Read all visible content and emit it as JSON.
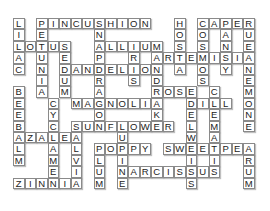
{
  "puzzle": {
    "type": "crossword",
    "theme": "flowers",
    "columns": 21,
    "rows": 15,
    "grid": [
      "L.PINCUSHION..H.CAPER",
      "I.E....N......O.O.A.U",
      "LOTUS..ALLIUM.S.S.N.E",
      "A.U.E..P..R.ARTEMISIA",
      "C.N.DANDELION.A.O.Y.N",
      "..I.U..R..S.D...S...E",
      "B.A.M..A....ROSE.C..M",
      "E..CMAGNOLIA..DILL.O",
      "E..Y...O....K..E.E..N",
      "B..C.SUNFLOWER.L.M..E",
      "AZALEA...U.....W.A...",
      "L..A.L.POPPY.SWEETPEA",
      "M..M.V.L.I.....I.I..R",
      "...E.I.U.NARCISSUS..U",
      "ZINNIA.M.E.....S....M"
    ],
    "words": {
      "across": [
        "PINCUSHION",
        "CAPER",
        "LOTUS",
        "ALLIUM",
        "ARTEMISIA",
        "DANDELION",
        "ROSE",
        "MAGNOLIA",
        "DILL",
        "SUNFLOWER",
        "AZALEA",
        "POPPY",
        "SWEETPEA",
        "NARCISSUS",
        "ZINNIA"
      ],
      "down": [
        "LILAC",
        "PETUNIA",
        "SNAPDRAGON",
        "IRIS",
        "SEDUM",
        "MANDRAKE",
        "HOSTA",
        "COSMOS",
        "PANSY",
        "RUE",
        "ANEMONE",
        "BEEBALM",
        "CYCLAMEN",
        "SALVIA",
        "LUPINE",
        "PLUM",
        "EDELWEISS",
        "CLEMATIS",
        "ARUM"
      ]
    },
    "cells": [
      {
        "r": 0,
        "c": 0,
        "ch": "L"
      },
      {
        "r": 0,
        "c": 2,
        "ch": "P"
      },
      {
        "r": 0,
        "c": 3,
        "ch": "I"
      },
      {
        "r": 0,
        "c": 4,
        "ch": "N"
      },
      {
        "r": 0,
        "c": 5,
        "ch": "C"
      },
      {
        "r": 0,
        "c": 6,
        "ch": "U"
      },
      {
        "r": 0,
        "c": 7,
        "ch": "S"
      },
      {
        "r": 0,
        "c": 8,
        "ch": "H"
      },
      {
        "r": 0,
        "c": 9,
        "ch": "I"
      },
      {
        "r": 0,
        "c": 10,
        "ch": "O"
      },
      {
        "r": 0,
        "c": 11,
        "ch": "N"
      },
      {
        "r": 0,
        "c": 14,
        "ch": "H"
      },
      {
        "r": 0,
        "c": 16,
        "ch": "C"
      },
      {
        "r": 0,
        "c": 17,
        "ch": "A"
      },
      {
        "r": 0,
        "c": 18,
        "ch": "P"
      },
      {
        "r": 0,
        "c": 19,
        "ch": "E"
      },
      {
        "r": 0,
        "c": 20,
        "ch": "R"
      },
      {
        "r": 1,
        "c": 0,
        "ch": "I"
      },
      {
        "r": 1,
        "c": 2,
        "ch": "E"
      },
      {
        "r": 1,
        "c": 7,
        "ch": "N"
      },
      {
        "r": 1,
        "c": 14,
        "ch": "O"
      },
      {
        "r": 1,
        "c": 16,
        "ch": "O"
      },
      {
        "r": 1,
        "c": 18,
        "ch": "A"
      },
      {
        "r": 1,
        "c": 20,
        "ch": "U"
      },
      {
        "r": 2,
        "c": 0,
        "ch": "L"
      },
      {
        "r": 2,
        "c": 1,
        "ch": "O"
      },
      {
        "r": 2,
        "c": 2,
        "ch": "T"
      },
      {
        "r": 2,
        "c": 3,
        "ch": "U"
      },
      {
        "r": 2,
        "c": 4,
        "ch": "S"
      },
      {
        "r": 2,
        "c": 7,
        "ch": "A"
      },
      {
        "r": 2,
        "c": 8,
        "ch": "L"
      },
      {
        "r": 2,
        "c": 9,
        "ch": "L"
      },
      {
        "r": 2,
        "c": 10,
        "ch": "I"
      },
      {
        "r": 2,
        "c": 11,
        "ch": "U"
      },
      {
        "r": 2,
        "c": 12,
        "ch": "M"
      },
      {
        "r": 2,
        "c": 14,
        "ch": "S"
      },
      {
        "r": 2,
        "c": 16,
        "ch": "S"
      },
      {
        "r": 2,
        "c": 18,
        "ch": "N"
      },
      {
        "r": 2,
        "c": 20,
        "ch": "E"
      },
      {
        "r": 3,
        "c": 0,
        "ch": "A"
      },
      {
        "r": 3,
        "c": 2,
        "ch": "U"
      },
      {
        "r": 3,
        "c": 4,
        "ch": "E"
      },
      {
        "r": 3,
        "c": 7,
        "ch": "P"
      },
      {
        "r": 3,
        "c": 10,
        "ch": "R"
      },
      {
        "r": 3,
        "c": 12,
        "ch": "A"
      },
      {
        "r": 3,
        "c": 13,
        "ch": "R"
      },
      {
        "r": 3,
        "c": 14,
        "ch": "T"
      },
      {
        "r": 3,
        "c": 15,
        "ch": "E"
      },
      {
        "r": 3,
        "c": 16,
        "ch": "M"
      },
      {
        "r": 3,
        "c": 17,
        "ch": "I"
      },
      {
        "r": 3,
        "c": 18,
        "ch": "S"
      },
      {
        "r": 3,
        "c": 19,
        "ch": "I"
      },
      {
        "r": 3,
        "c": 20,
        "ch": "A"
      },
      {
        "r": 4,
        "c": 0,
        "ch": "C"
      },
      {
        "r": 4,
        "c": 2,
        "ch": "N"
      },
      {
        "r": 4,
        "c": 4,
        "ch": "D"
      },
      {
        "r": 4,
        "c": 5,
        "ch": "A"
      },
      {
        "r": 4,
        "c": 6,
        "ch": "N"
      },
      {
        "r": 4,
        "c": 7,
        "ch": "D"
      },
      {
        "r": 4,
        "c": 8,
        "ch": "E"
      },
      {
        "r": 4,
        "c": 9,
        "ch": "L"
      },
      {
        "r": 4,
        "c": 10,
        "ch": "I"
      },
      {
        "r": 4,
        "c": 11,
        "ch": "O"
      },
      {
        "r": 4,
        "c": 12,
        "ch": "N"
      },
      {
        "r": 4,
        "c": 14,
        "ch": "A"
      },
      {
        "r": 4,
        "c": 16,
        "ch": "O"
      },
      {
        "r": 4,
        "c": 18,
        "ch": "Y"
      },
      {
        "r": 4,
        "c": 20,
        "ch": "N"
      },
      {
        "r": 5,
        "c": 2,
        "ch": "I"
      },
      {
        "r": 5,
        "c": 4,
        "ch": "U"
      },
      {
        "r": 5,
        "c": 7,
        "ch": "R"
      },
      {
        "r": 5,
        "c": 10,
        "ch": "S"
      },
      {
        "r": 5,
        "c": 12,
        "ch": "D"
      },
      {
        "r": 5,
        "c": 16,
        "ch": "S"
      },
      {
        "r": 5,
        "c": 20,
        "ch": "E"
      },
      {
        "r": 6,
        "c": 0,
        "ch": "B"
      },
      {
        "r": 6,
        "c": 2,
        "ch": "A"
      },
      {
        "r": 6,
        "c": 4,
        "ch": "M"
      },
      {
        "r": 6,
        "c": 7,
        "ch": "A"
      },
      {
        "r": 6,
        "c": 12,
        "ch": "R"
      },
      {
        "r": 6,
        "c": 13,
        "ch": "O"
      },
      {
        "r": 6,
        "c": 14,
        "ch": "S"
      },
      {
        "r": 6,
        "c": 15,
        "ch": "E"
      },
      {
        "r": 6,
        "c": 17,
        "ch": "C"
      },
      {
        "r": 6,
        "c": 20,
        "ch": "M"
      },
      {
        "r": 7,
        "c": 0,
        "ch": "E"
      },
      {
        "r": 7,
        "c": 3,
        "ch": "C"
      },
      {
        "r": 7,
        "c": 5,
        "ch": "M"
      },
      {
        "r": 7,
        "c": 6,
        "ch": "A"
      },
      {
        "r": 7,
        "c": 7,
        "ch": "G"
      },
      {
        "r": 7,
        "c": 8,
        "ch": "N"
      },
      {
        "r": 7,
        "c": 9,
        "ch": "O"
      },
      {
        "r": 7,
        "c": 10,
        "ch": "L"
      },
      {
        "r": 7,
        "c": 11,
        "ch": "I"
      },
      {
        "r": 7,
        "c": 12,
        "ch": "A"
      },
      {
        "r": 7,
        "c": 15,
        "ch": "D"
      },
      {
        "r": 7,
        "c": 16,
        "ch": "I"
      },
      {
        "r": 7,
        "c": 17,
        "ch": "L"
      },
      {
        "r": 7,
        "c": 18,
        "ch": "L"
      },
      {
        "r": 7,
        "c": 20,
        "ch": "O"
      },
      {
        "r": 8,
        "c": 0,
        "ch": "E"
      },
      {
        "r": 8,
        "c": 3,
        "ch": "Y"
      },
      {
        "r": 8,
        "c": 7,
        "ch": "O"
      },
      {
        "r": 8,
        "c": 12,
        "ch": "K"
      },
      {
        "r": 8,
        "c": 15,
        "ch": "E"
      },
      {
        "r": 8,
        "c": 17,
        "ch": "E"
      },
      {
        "r": 8,
        "c": 20,
        "ch": "N"
      },
      {
        "r": 9,
        "c": 0,
        "ch": "B"
      },
      {
        "r": 9,
        "c": 3,
        "ch": "C"
      },
      {
        "r": 9,
        "c": 5,
        "ch": "S"
      },
      {
        "r": 9,
        "c": 6,
        "ch": "U"
      },
      {
        "r": 9,
        "c": 7,
        "ch": "N"
      },
      {
        "r": 9,
        "c": 8,
        "ch": "F"
      },
      {
        "r": 9,
        "c": 9,
        "ch": "L"
      },
      {
        "r": 9,
        "c": 10,
        "ch": "O"
      },
      {
        "r": 9,
        "c": 11,
        "ch": "W"
      },
      {
        "r": 9,
        "c": 12,
        "ch": "E"
      },
      {
        "r": 9,
        "c": 13,
        "ch": "R"
      },
      {
        "r": 9,
        "c": 15,
        "ch": "L"
      },
      {
        "r": 9,
        "c": 17,
        "ch": "M"
      },
      {
        "r": 9,
        "c": 20,
        "ch": "E"
      },
      {
        "r": 10,
        "c": 0,
        "ch": "A"
      },
      {
        "r": 10,
        "c": 1,
        "ch": "Z"
      },
      {
        "r": 10,
        "c": 2,
        "ch": "A"
      },
      {
        "r": 10,
        "c": 3,
        "ch": "L"
      },
      {
        "r": 10,
        "c": 4,
        "ch": "E"
      },
      {
        "r": 10,
        "c": 5,
        "ch": "A"
      },
      {
        "r": 10,
        "c": 9,
        "ch": "U"
      },
      {
        "r": 10,
        "c": 15,
        "ch": "W"
      },
      {
        "r": 10,
        "c": 17,
        "ch": "A"
      },
      {
        "r": 11,
        "c": 0,
        "ch": "L"
      },
      {
        "r": 11,
        "c": 3,
        "ch": "A"
      },
      {
        "r": 11,
        "c": 5,
        "ch": "L"
      },
      {
        "r": 11,
        "c": 7,
        "ch": "P"
      },
      {
        "r": 11,
        "c": 8,
        "ch": "O"
      },
      {
        "r": 11,
        "c": 9,
        "ch": "P"
      },
      {
        "r": 11,
        "c": 10,
        "ch": "P"
      },
      {
        "r": 11,
        "c": 11,
        "ch": "Y"
      },
      {
        "r": 11,
        "c": 13,
        "ch": "S"
      },
      {
        "r": 11,
        "c": 14,
        "ch": "W"
      },
      {
        "r": 11,
        "c": 15,
        "ch": "E"
      },
      {
        "r": 11,
        "c": 16,
        "ch": "E"
      },
      {
        "r": 11,
        "c": 17,
        "ch": "T"
      },
      {
        "r": 11,
        "c": 18,
        "ch": "P"
      },
      {
        "r": 11,
        "c": 19,
        "ch": "E"
      },
      {
        "r": 11,
        "c": 20,
        "ch": "A"
      },
      {
        "r": 12,
        "c": 0,
        "ch": "M"
      },
      {
        "r": 12,
        "c": 3,
        "ch": "M"
      },
      {
        "r": 12,
        "c": 5,
        "ch": "V"
      },
      {
        "r": 12,
        "c": 7,
        "ch": "L"
      },
      {
        "r": 12,
        "c": 9,
        "ch": "I"
      },
      {
        "r": 12,
        "c": 15,
        "ch": "I"
      },
      {
        "r": 12,
        "c": 17,
        "ch": "I"
      },
      {
        "r": 12,
        "c": 20,
        "ch": "R"
      },
      {
        "r": 13,
        "c": 3,
        "ch": "E"
      },
      {
        "r": 13,
        "c": 5,
        "ch": "I"
      },
      {
        "r": 13,
        "c": 7,
        "ch": "U"
      },
      {
        "r": 13,
        "c": 9,
        "ch": "N"
      },
      {
        "r": 13,
        "c": 10,
        "ch": "A"
      },
      {
        "r": 13,
        "c": 11,
        "ch": "R"
      },
      {
        "r": 13,
        "c": 12,
        "ch": "C"
      },
      {
        "r": 13,
        "c": 13,
        "ch": "I"
      },
      {
        "r": 13,
        "c": 14,
        "ch": "S"
      },
      {
        "r": 13,
        "c": 15,
        "ch": "S"
      },
      {
        "r": 13,
        "c": 16,
        "ch": "U"
      },
      {
        "r": 13,
        "c": 17,
        "ch": "S"
      },
      {
        "r": 13,
        "c": 20,
        "ch": "U"
      },
      {
        "r": 14,
        "c": 0,
        "ch": "Z"
      },
      {
        "r": 14,
        "c": 1,
        "ch": "I"
      },
      {
        "r": 14,
        "c": 2,
        "ch": "N"
      },
      {
        "r": 14,
        "c": 3,
        "ch": "N"
      },
      {
        "r": 14,
        "c": 4,
        "ch": "I"
      },
      {
        "r": 14,
        "c": 5,
        "ch": "A"
      },
      {
        "r": 14,
        "c": 7,
        "ch": "M"
      },
      {
        "r": 14,
        "c": 9,
        "ch": "E"
      },
      {
        "r": 14,
        "c": 15,
        "ch": "S"
      },
      {
        "r": 14,
        "c": 20,
        "ch": "M"
      }
    ]
  }
}
